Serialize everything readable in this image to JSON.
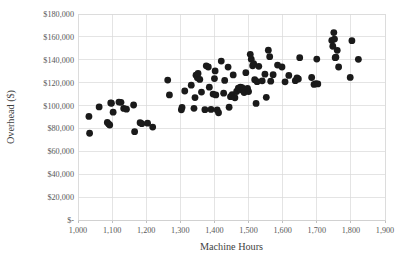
{
  "chart_data": {
    "type": "scatter",
    "title": "",
    "xlabel": "Machine Hours",
    "ylabel": "Overhead ($)",
    "xlim": [
      1000,
      1900
    ],
    "ylim": [
      0,
      180000
    ],
    "xticks": [
      1000,
      1100,
      1200,
      1300,
      1400,
      1500,
      1600,
      1700,
      1800,
      1900
    ],
    "xtick_labels": [
      "1,000",
      "1,100",
      "1,200",
      "1,300",
      "1,400",
      "1,500",
      "1,600",
      "1,700",
      "1,800",
      "1,900"
    ],
    "yticks": [
      0,
      20000,
      40000,
      60000,
      80000,
      100000,
      120000,
      140000,
      160000,
      180000
    ],
    "ytick_labels": [
      "$-",
      "$20,000",
      "$40,000",
      "$60,000",
      "$80,000",
      "$100,000",
      "$120,000",
      "$140,000",
      "$160,000",
      "$180,000"
    ],
    "grid": true,
    "legend": false,
    "marker": "filled-circle",
    "marker_color": "#1a1a1a",
    "marker_size": 3.4,
    "series": [
      {
        "name": "Overhead vs Machine Hours",
        "points": [
          [
            1032,
            90500
          ],
          [
            1034,
            75800
          ],
          [
            1062,
            98800
          ],
          [
            1086,
            85200
          ],
          [
            1090,
            83800
          ],
          [
            1093,
            83000
          ],
          [
            1096,
            102300
          ],
          [
            1098,
            102000
          ],
          [
            1103,
            94200
          ],
          [
            1120,
            103000
          ],
          [
            1126,
            102800
          ],
          [
            1134,
            97500
          ],
          [
            1142,
            96800
          ],
          [
            1163,
            100500
          ],
          [
            1166,
            77200
          ],
          [
            1182,
            85000
          ],
          [
            1187,
            84200
          ],
          [
            1204,
            84600
          ],
          [
            1219,
            81200
          ],
          [
            1263,
            122300
          ],
          [
            1268,
            109300
          ],
          [
            1303,
            96300
          ],
          [
            1305,
            98300
          ],
          [
            1313,
            112700
          ],
          [
            1332,
            117800
          ],
          [
            1340,
            97600
          ],
          [
            1343,
            107000
          ],
          [
            1346,
            126500
          ],
          [
            1350,
            124200
          ],
          [
            1352,
            128000
          ],
          [
            1357,
            122800
          ],
          [
            1362,
            111800
          ],
          [
            1372,
            96400
          ],
          [
            1376,
            134700
          ],
          [
            1382,
            133700
          ],
          [
            1385,
            116100
          ],
          [
            1390,
            96600
          ],
          [
            1396,
            110000
          ],
          [
            1400,
            123600
          ],
          [
            1402,
            130300
          ],
          [
            1404,
            109300
          ],
          [
            1408,
            96200
          ],
          [
            1412,
            93700
          ],
          [
            1420,
            138900
          ],
          [
            1427,
            110800
          ],
          [
            1430,
            122000
          ],
          [
            1440,
            133600
          ],
          [
            1443,
            98500
          ],
          [
            1447,
            107800
          ],
          [
            1452,
            109600
          ],
          [
            1455,
            126800
          ],
          [
            1460,
            106800
          ],
          [
            1465,
            112300
          ],
          [
            1470,
            115200
          ],
          [
            1474,
            114800
          ],
          [
            1476,
            116000
          ],
          [
            1478,
            114000
          ],
          [
            1481,
            115600
          ],
          [
            1484,
            113000
          ],
          [
            1487,
            111400
          ],
          [
            1492,
            128700
          ],
          [
            1497,
            115000
          ],
          [
            1500,
            112200
          ],
          [
            1505,
            144800
          ],
          [
            1508,
            140500
          ],
          [
            1512,
            134800
          ],
          [
            1515,
            136700
          ],
          [
            1518,
            122600
          ],
          [
            1522,
            101900
          ],
          [
            1525,
            120900
          ],
          [
            1530,
            134300
          ],
          [
            1540,
            121600
          ],
          [
            1548,
            127400
          ],
          [
            1552,
            107200
          ],
          [
            1558,
            148400
          ],
          [
            1562,
            142700
          ],
          [
            1565,
            121300
          ],
          [
            1572,
            127000
          ],
          [
            1585,
            135400
          ],
          [
            1598,
            133700
          ],
          [
            1607,
            120700
          ],
          [
            1618,
            126300
          ],
          [
            1637,
            121700
          ],
          [
            1642,
            124200
          ],
          [
            1646,
            123200
          ],
          [
            1650,
            141800
          ],
          [
            1685,
            124500
          ],
          [
            1692,
            118500
          ],
          [
            1697,
            119200
          ],
          [
            1700,
            140600
          ],
          [
            1703,
            118900
          ],
          [
            1744,
            156900
          ],
          [
            1747,
            151800
          ],
          [
            1750,
            163800
          ],
          [
            1752,
            158100
          ],
          [
            1754,
            141800
          ],
          [
            1756,
            142200
          ],
          [
            1760,
            148300
          ],
          [
            1764,
            133700
          ],
          [
            1798,
            124600
          ],
          [
            1803,
            156700
          ],
          [
            1822,
            140400
          ]
        ]
      }
    ]
  },
  "axes": {
    "x_title": "Machine Hours",
    "y_title": "Overhead ($)"
  }
}
